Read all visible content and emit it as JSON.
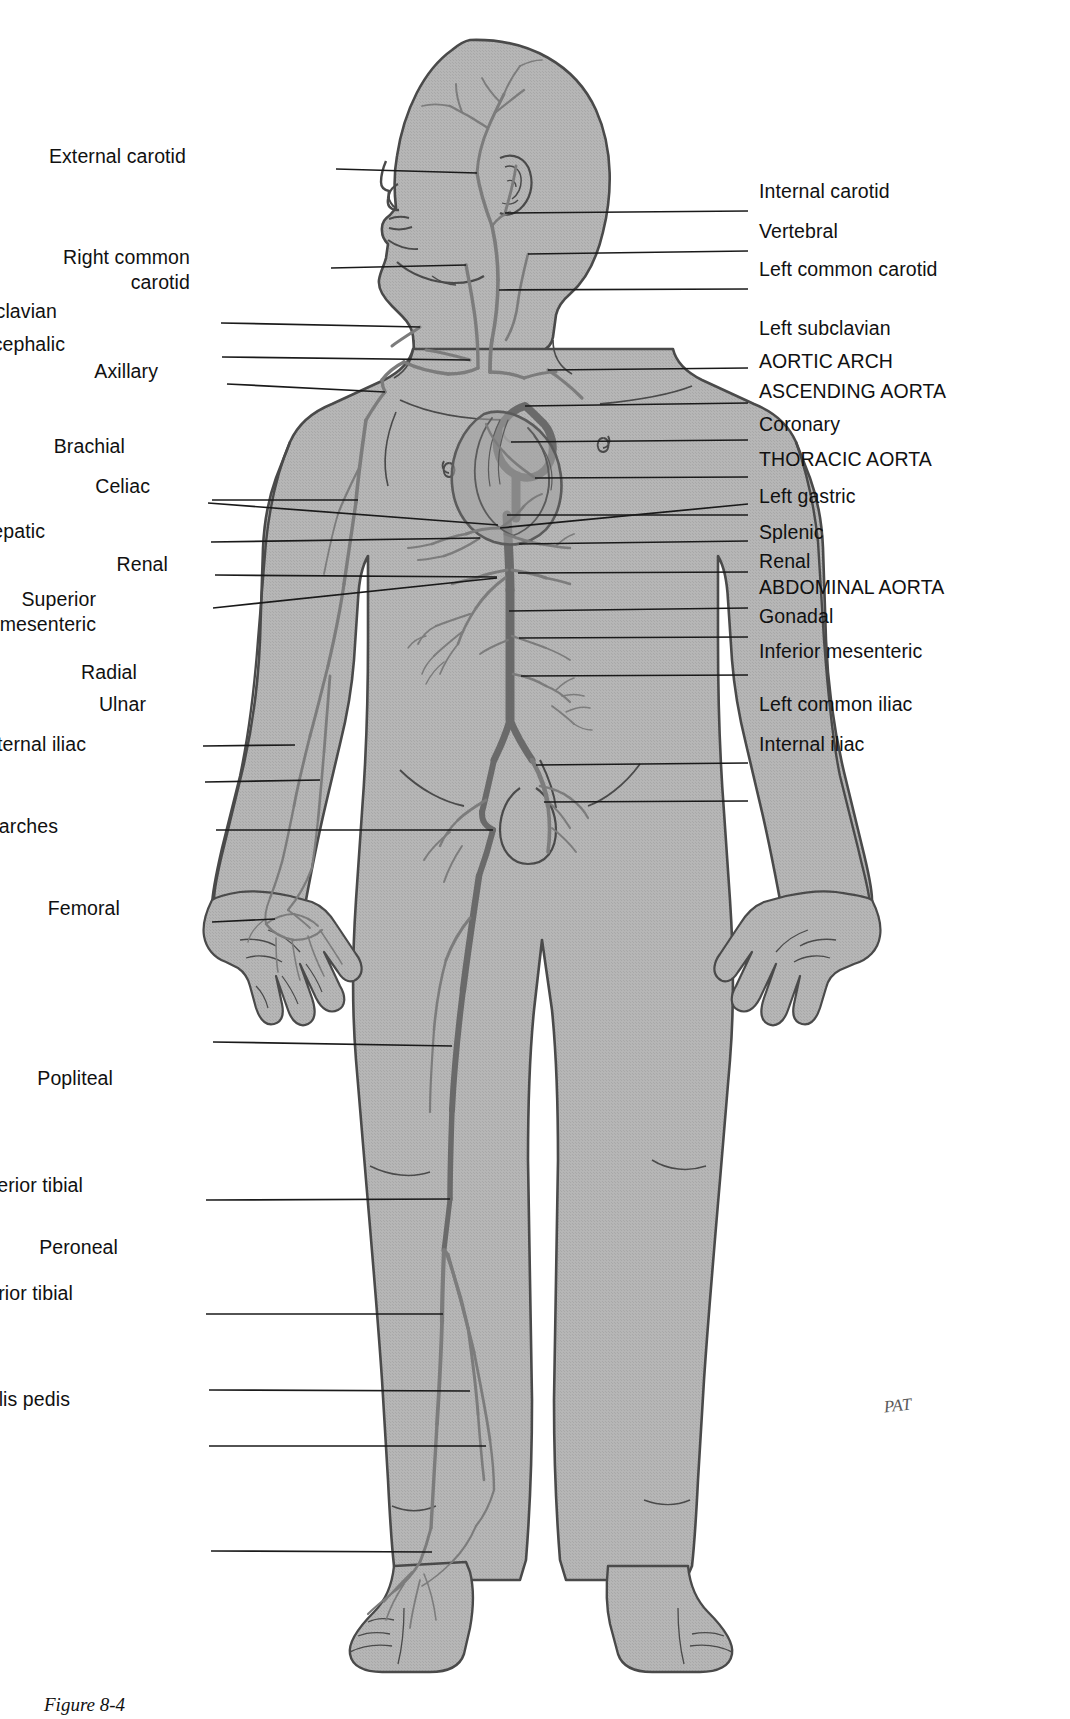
{
  "figure": {
    "caption": "Figure 8-4",
    "artist_signature": "PAT",
    "view": "anterior",
    "colors": {
      "body_fill": "#b3b3b3",
      "body_outline": "#4a4a4a",
      "artery": "#7c7c7c",
      "artery_outline": "#5b5b5b",
      "leader_line": "#1a1a1a",
      "label_text": "#111111",
      "background": "#ffffff"
    }
  },
  "labels_left": [
    {
      "id": "external-carotid",
      "text": "External carotid",
      "lines": [
        "External carotid"
      ],
      "label_x": 186,
      "label_y": 157,
      "tip_x": 477,
      "tip_y": 173,
      "elbow_x": 336,
      "elbow_y": 169
    },
    {
      "id": "right-common-carotid",
      "text": "Right common carotid",
      "lines": [
        "Right common",
        "carotid"
      ],
      "label_x": 190,
      "label_y": 258,
      "tip_x": 466,
      "tip_y": 265,
      "elbow_x": 331,
      "elbow_y": 268
    },
    {
      "id": "right-subclavian",
      "text": "Right subclavian",
      "lines": [
        "Right subclavian"
      ],
      "label_x": 57,
      "label_y": 312,
      "tip_x": 420,
      "tip_y": 327,
      "elbow_x": 221,
      "elbow_y": 323
    },
    {
      "id": "brachiocephalic",
      "text": "Brachiocephalic",
      "lines": [
        "Brachiocephalic"
      ],
      "label_x": 65,
      "label_y": 345,
      "tip_x": 470,
      "tip_y": 360,
      "elbow_x": 222,
      "elbow_y": 357
    },
    {
      "id": "axillary",
      "text": "Axillary",
      "lines": [
        "Axillary"
      ],
      "label_x": 158,
      "label_y": 372,
      "tip_x": 385,
      "tip_y": 392,
      "elbow_x": 227,
      "elbow_y": 384
    },
    {
      "id": "brachial",
      "text": "Brachial",
      "lines": [
        "Brachial"
      ],
      "label_x": 125,
      "label_y": 447,
      "tip_x": 358,
      "tip_y": 500,
      "elbow_x": 212,
      "elbow_y": 500
    },
    {
      "id": "celiac",
      "text": "Celiac",
      "lines": [
        "Celiac"
      ],
      "label_x": 150,
      "label_y": 487,
      "tip_x": 498,
      "tip_y": 525,
      "elbow_x": 208,
      "elbow_y": 503
    },
    {
      "id": "common-hepatic",
      "text": "Common hepatic",
      "lines": [
        "Common hepatic"
      ],
      "label_x": 45,
      "label_y": 532,
      "tip_x": 480,
      "tip_y": 538,
      "elbow_x": 211,
      "elbow_y": 542
    },
    {
      "id": "renal-left-label",
      "text": "Renal",
      "lines": [
        "Renal"
      ],
      "label_x": 168,
      "label_y": 565,
      "tip_x": 497,
      "tip_y": 577,
      "elbow_x": 215,
      "elbow_y": 575
    },
    {
      "id": "superior-mesenteric",
      "text": "Superior mesenteric",
      "lines": [
        "Superior",
        "mesenteric"
      ],
      "label_x": 96,
      "label_y": 600,
      "tip_x": 497,
      "tip_y": 578,
      "elbow_x": 213,
      "elbow_y": 608
    },
    {
      "id": "radial",
      "text": "Radial",
      "lines": [
        "Radial"
      ],
      "label_x": 137,
      "label_y": 673,
      "tip_x": 295,
      "tip_y": 745,
      "elbow_x": 203,
      "elbow_y": 746
    },
    {
      "id": "ulnar",
      "text": "Ulnar",
      "lines": [
        "Ulnar"
      ],
      "label_x": 146,
      "label_y": 705,
      "tip_x": 320,
      "tip_y": 780,
      "elbow_x": 205,
      "elbow_y": 782
    },
    {
      "id": "external-iliac",
      "text": "External iliac",
      "lines": [
        "External iliac"
      ],
      "label_x": 86,
      "label_y": 745,
      "tip_x": 493,
      "tip_y": 830,
      "elbow_x": 216,
      "elbow_y": 830
    },
    {
      "id": "palmar-arches",
      "text": "Palmar arches",
      "lines": [
        "Palmar arches"
      ],
      "label_x": 58,
      "label_y": 827,
      "tip_x": 275,
      "tip_y": 919,
      "elbow_x": 212,
      "elbow_y": 922
    },
    {
      "id": "femoral",
      "text": "Femoral",
      "lines": [
        "Femoral"
      ],
      "label_x": 120,
      "label_y": 909,
      "tip_x": 452,
      "tip_y": 1046,
      "elbow_x": 213,
      "elbow_y": 1042
    },
    {
      "id": "popliteal",
      "text": "Popliteal",
      "lines": [
        "Popliteal"
      ],
      "label_x": 113,
      "label_y": 1079,
      "tip_x": 450,
      "tip_y": 1199,
      "elbow_x": 206,
      "elbow_y": 1200
    },
    {
      "id": "anterior-tibial",
      "text": "Anterior tibial",
      "lines": [
        "Anterior tibial"
      ],
      "label_x": 83,
      "label_y": 1186,
      "tip_x": 443,
      "tip_y": 1314,
      "elbow_x": 206,
      "elbow_y": 1314
    },
    {
      "id": "peroneal",
      "text": "Peroneal",
      "lines": [
        "Peroneal"
      ],
      "label_x": 118,
      "label_y": 1248,
      "tip_x": 470,
      "tip_y": 1391,
      "elbow_x": 209,
      "elbow_y": 1390
    },
    {
      "id": "posterior-tibial",
      "text": "Posterior tibial",
      "lines": [
        "Posterior tibial"
      ],
      "label_x": 73,
      "label_y": 1294,
      "tip_x": 486,
      "tip_y": 1446,
      "elbow_x": 209,
      "elbow_y": 1446
    },
    {
      "id": "dorsalis-pedis",
      "text": "Dorsalis pedis",
      "lines": [
        "Dorsalis pedis"
      ],
      "label_x": 70,
      "label_y": 1400,
      "tip_x": 432,
      "tip_y": 1552,
      "elbow_x": 211,
      "elbow_y": 1551
    }
  ],
  "labels_right": [
    {
      "id": "internal-carotid",
      "text": "Internal carotid",
      "lines": [
        "Internal carotid"
      ],
      "label_x": 759,
      "label_y": 192,
      "tip_x": 505,
      "tip_y": 213,
      "elbow_x": 748,
      "elbow_y": 211
    },
    {
      "id": "vertebral",
      "text": "Vertebral",
      "lines": [
        "Vertebral"
      ],
      "label_x": 759,
      "label_y": 232,
      "tip_x": 528,
      "tip_y": 254,
      "elbow_x": 748,
      "elbow_y": 251
    },
    {
      "id": "left-common-carotid",
      "text": "Left common carotid",
      "lines": [
        "Left common carotid"
      ],
      "label_x": 759,
      "label_y": 270,
      "tip_x": 499,
      "tip_y": 290,
      "elbow_x": 748,
      "elbow_y": 289
    },
    {
      "id": "left-subclavian",
      "text": "Left subclavian",
      "lines": [
        "Left subclavian"
      ],
      "label_x": 759,
      "label_y": 329,
      "tip_x": 548,
      "tip_y": 370,
      "elbow_x": 748,
      "elbow_y": 368
    },
    {
      "id": "aortic-arch",
      "text": "AORTIC ARCH",
      "lines": [
        "AORTIC ARCH"
      ],
      "label_x": 759,
      "label_y": 362,
      "tip_x": 525,
      "tip_y": 406,
      "elbow_x": 748,
      "elbow_y": 403
    },
    {
      "id": "ascending-aorta",
      "text": "ASCENDING AORTA",
      "lines": [
        "ASCENDING AORTA"
      ],
      "label_x": 759,
      "label_y": 392,
      "tip_x": 511,
      "tip_y": 442,
      "elbow_x": 748,
      "elbow_y": 440
    },
    {
      "id": "coronary",
      "text": "Coronary",
      "lines": [
        "Coronary"
      ],
      "label_x": 759,
      "label_y": 425,
      "tip_x": 535,
      "tip_y": 478,
      "elbow_x": 748,
      "elbow_y": 477
    },
    {
      "id": "thoracic-aorta",
      "text": "THORACIC AORTA",
      "lines": [
        "THORACIC AORTA"
      ],
      "label_x": 759,
      "label_y": 460,
      "tip_x": 507,
      "tip_y": 515,
      "elbow_x": 748,
      "elbow_y": 515
    },
    {
      "id": "left-gastric",
      "text": "Left gastric",
      "lines": [
        "Left gastric"
      ],
      "label_x": 759,
      "label_y": 497,
      "tip_x": 500,
      "tip_y": 528,
      "elbow_x": 748,
      "elbow_y": 504
    },
    {
      "id": "splenic",
      "text": "Splenic",
      "lines": [
        "Splenic"
      ],
      "label_x": 759,
      "label_y": 533,
      "tip_x": 519,
      "tip_y": 544,
      "elbow_x": 748,
      "elbow_y": 541
    },
    {
      "id": "renal-right-label",
      "text": "Renal",
      "lines": [
        "Renal"
      ],
      "label_x": 759,
      "label_y": 562,
      "tip_x": 518,
      "tip_y": 573,
      "elbow_x": 748,
      "elbow_y": 572
    },
    {
      "id": "abdominal-aorta",
      "text": "ABDOMINAL AORTA",
      "lines": [
        "ABDOMINAL AORTA"
      ],
      "label_x": 759,
      "label_y": 588,
      "tip_x": 509,
      "tip_y": 611,
      "elbow_x": 748,
      "elbow_y": 608
    },
    {
      "id": "gonadal",
      "text": "Gonadal",
      "lines": [
        "Gonadal"
      ],
      "label_x": 759,
      "label_y": 617,
      "tip_x": 519,
      "tip_y": 638,
      "elbow_x": 748,
      "elbow_y": 637
    },
    {
      "id": "inferior-mesenteric",
      "text": "Inferior mesenteric",
      "lines": [
        "Inferior mesenteric"
      ],
      "label_x": 759,
      "label_y": 652,
      "tip_x": 521,
      "tip_y": 676,
      "elbow_x": 748,
      "elbow_y": 675
    },
    {
      "id": "left-common-iliac",
      "text": "Left common iliac",
      "lines": [
        "Left common iliac"
      ],
      "label_x": 759,
      "label_y": 705,
      "tip_x": 536,
      "tip_y": 765,
      "elbow_x": 748,
      "elbow_y": 763
    },
    {
      "id": "internal-iliac",
      "text": "Internal iliac",
      "lines": [
        "Internal iliac"
      ],
      "label_x": 759,
      "label_y": 745,
      "tip_x": 544,
      "tip_y": 802,
      "elbow_x": 748,
      "elbow_y": 801
    }
  ]
}
